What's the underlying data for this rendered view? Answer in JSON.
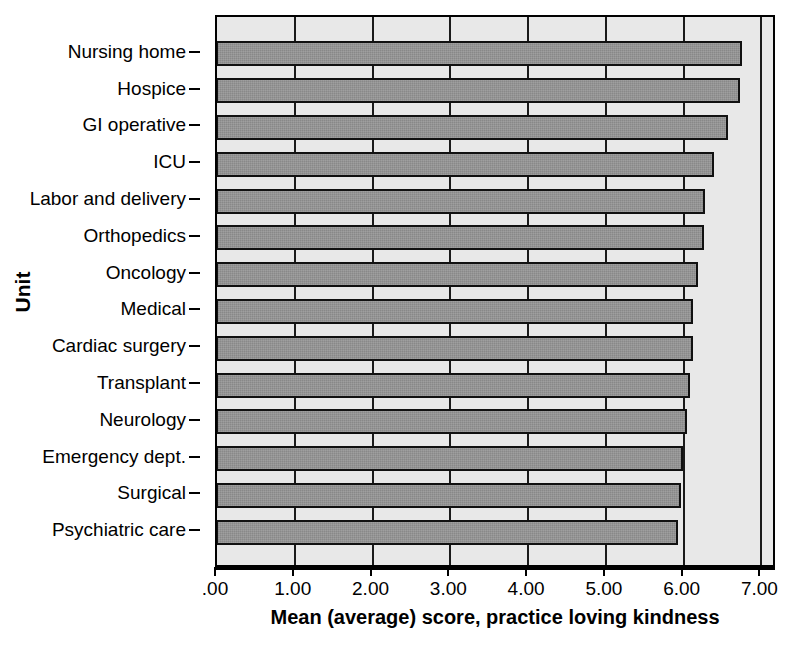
{
  "chart_data": {
    "type": "bar",
    "orientation": "horizontal",
    "title": "",
    "xlabel": "Mean (average) score, practice loving kindness",
    "ylabel": "Unit",
    "xlim": [
      0,
      7.2
    ],
    "grid": true,
    "legend": "none",
    "xticks": [
      ".00",
      "1.00",
      "2.00",
      "3.00",
      "4.00",
      "5.00",
      "6.00",
      "7.00"
    ],
    "xtick_values": [
      0,
      1,
      2,
      3,
      4,
      5,
      6,
      7
    ],
    "categories": [
      "Nursing home",
      "Hospice",
      "GI operative",
      "ICU",
      "Labor and delivery",
      "Orthopedics",
      "Oncology",
      "Medical",
      "Cardiac surgery",
      "Transplant",
      "Neurology",
      "Emergency dept.",
      "Surgical",
      "Psychiatric care"
    ],
    "values": [
      6.75,
      6.73,
      6.57,
      6.39,
      6.27,
      6.26,
      6.19,
      6.12,
      6.12,
      6.08,
      6.04,
      5.99,
      5.96,
      5.93
    ],
    "bar_color": "#8e8e8e",
    "bar_edge_color": "#111111",
    "plot_background": "#e8e8e8"
  }
}
